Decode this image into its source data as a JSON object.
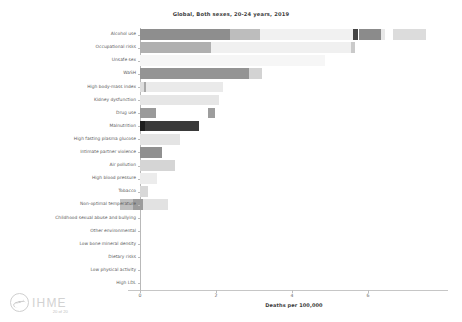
{
  "chart_data": {
    "type": "bar",
    "orientation": "horizontal",
    "stacked": true,
    "title": "Global, Both sexes, 20-24 years, 2019",
    "xlabel": "Deaths per 100,000",
    "ylabel": "",
    "xlim": [
      -0.95,
      7.55
    ],
    "xticks": [
      0,
      2,
      4,
      6
    ],
    "xticklabels": [
      "0",
      "2",
      "4",
      "6"
    ],
    "grid": false,
    "legend": "none",
    "categories": [
      "Alcohol use",
      "Occupational risks",
      "Unsafe sex",
      "WaSH",
      "High body-mass index",
      "Kidney dysfunction",
      "Drug use",
      "Malnutrition",
      "High fasting plasma glucose",
      "Intimate partner violence",
      "Air pollution",
      "High blood pressure",
      "Tobacco",
      "Non-optimal temperature",
      "Childhood sexual abuse and bullying",
      "Other environmental",
      "Low bone mineral density",
      "Dietary risks",
      "Low physical activity",
      "High LDL"
    ],
    "bars": [
      {
        "category": "Alcohol use",
        "segments": [
          {
            "start": 0.0,
            "end": 2.36,
            "color": "#8e8e8e"
          },
          {
            "start": 2.36,
            "end": 3.15,
            "color": "#bdbdbd"
          },
          {
            "start": 3.15,
            "end": 5.61,
            "color": "#f1f1f1"
          },
          {
            "start": 5.61,
            "end": 5.75,
            "color": "#434343"
          },
          {
            "start": 5.75,
            "end": 6.33,
            "color": "#8b8b8b"
          },
          {
            "start": 6.33,
            "end": 6.45,
            "color": "#e8e8e8"
          },
          {
            "start": 6.66,
            "end": 7.52,
            "color": "#dcdcdc"
          }
        ]
      },
      {
        "category": "Occupational risks",
        "segments": [
          {
            "start": 0.0,
            "end": 1.86,
            "color": "#b0b0b0"
          },
          {
            "start": 1.86,
            "end": 5.55,
            "color": "#f0f0f0"
          },
          {
            "start": 5.55,
            "end": 5.66,
            "color": "#cacaca"
          }
        ]
      },
      {
        "category": "Unsafe sex",
        "segments": [
          {
            "start": 0.0,
            "end": 4.88,
            "color": "#f6f6f6"
          }
        ]
      },
      {
        "category": "WaSH",
        "segments": [
          {
            "start": 0.0,
            "end": 2.87,
            "color": "#949494"
          },
          {
            "start": 2.87,
            "end": 3.22,
            "color": "#d3d3d3"
          }
        ]
      },
      {
        "category": "High body-mass index",
        "segments": [
          {
            "start": 0.0,
            "end": 0.1,
            "color": "#dedede"
          },
          {
            "start": 0.1,
            "end": 0.17,
            "color": "#a8a8a8"
          },
          {
            "start": 0.17,
            "end": 2.18,
            "color": "#eaeaea"
          }
        ]
      },
      {
        "category": "Kidney dysfunction",
        "segments": [
          {
            "start": 0.0,
            "end": 2.09,
            "color": "#e6e6e6"
          }
        ]
      },
      {
        "category": "Drug use",
        "segments": [
          {
            "start": 0.0,
            "end": 0.41,
            "color": "#9a9a9a"
          },
          {
            "start": 1.78,
            "end": 1.98,
            "color": "#9d9d9d"
          }
        ]
      },
      {
        "category": "Malnutrition",
        "segments": [
          {
            "start": 0.0,
            "end": 0.13,
            "color": "#1f1f1f"
          },
          {
            "start": 0.13,
            "end": 1.56,
            "color": "#3a3a3a"
          }
        ]
      },
      {
        "category": "High fasting plasma glucose",
        "segments": [
          {
            "start": 0.0,
            "end": 1.06,
            "color": "#e4e4e4"
          }
        ]
      },
      {
        "category": "Intimate partner violence",
        "segments": [
          {
            "start": 0.0,
            "end": 0.59,
            "color": "#909090"
          }
        ]
      },
      {
        "category": "Air pollution",
        "segments": [
          {
            "start": 0.0,
            "end": 0.92,
            "color": "#d5d5d5"
          }
        ]
      },
      {
        "category": "High blood pressure",
        "segments": [
          {
            "start": 0.0,
            "end": 0.46,
            "color": "#ececec"
          }
        ]
      },
      {
        "category": "Tobacco",
        "segments": [
          {
            "start": 0.0,
            "end": 0.22,
            "color": "#d8d8d8"
          }
        ]
      },
      {
        "category": "Non-optimal temperature",
        "segments": [
          {
            "start": -0.52,
            "end": -0.18,
            "color": "#bfbfbf"
          },
          {
            "start": -0.18,
            "end": 0.07,
            "color": "#9c9c9c"
          },
          {
            "start": 0.07,
            "end": 0.74,
            "color": "#e2e2e2"
          }
        ]
      },
      {
        "category": "Childhood sexual abuse and bullying",
        "segments": []
      },
      {
        "category": "Other environmental",
        "segments": []
      },
      {
        "category": "Low bone mineral density",
        "segments": []
      },
      {
        "category": "Dietary risks",
        "segments": []
      },
      {
        "category": "Low physical activity",
        "segments": []
      },
      {
        "category": "High LDL",
        "segments": []
      }
    ]
  },
  "footer": {
    "logo_text": "IHME",
    "page_indicator": "20 of 20"
  }
}
